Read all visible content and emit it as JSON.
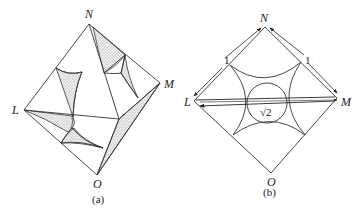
{
  "figure_a": {
    "vertices": {
      "N": "N",
      "M": "M",
      "L": "L",
      "O": "O"
    },
    "caption": "(a)",
    "description": "3D octahedral view with stippled shaded cusp regions"
  },
  "figure_b": {
    "vertices": {
      "N": "N",
      "M": "M",
      "L": "L",
      "O": "O"
    },
    "edge_label_left": "1",
    "edge_label_right": "1",
    "diagonal_label": "√2",
    "caption": "(b)",
    "description": "Square cross-section with four quarter-circle arcs and inscribed central circle"
  },
  "colors": {
    "line": "#333333",
    "shade": "#9a9a9a",
    "background": "#ffffff"
  }
}
